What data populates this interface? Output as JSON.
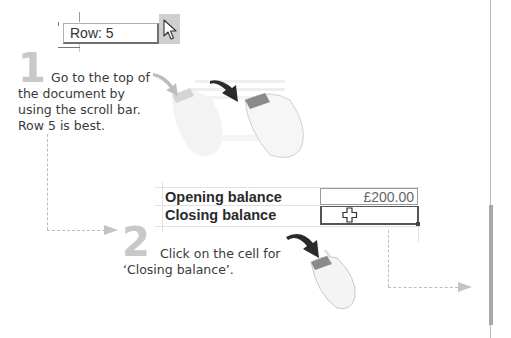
{
  "row_indicator": {
    "label": "Row: 5",
    "cursor_icon": "arrow-pointer-icon"
  },
  "step1": {
    "number": "1",
    "text_line1": "Go to the top of",
    "text_rest": "the document by using the scroll bar. Row 5 is best."
  },
  "step2": {
    "number": "2",
    "text_line1": "Click on the cell for",
    "text_rest": "‘Closing balance’."
  },
  "spreadsheet": {
    "rows": [
      {
        "label": "Opening balance",
        "value": "£200.00"
      },
      {
        "label": "Closing balance",
        "value": ""
      }
    ],
    "cursor_icon": "cell-cross-cursor-icon"
  },
  "illustrations": {
    "mouse1": "mouse-scroll-motion-icon",
    "mouse2": "mouse-click-icon"
  },
  "colors": {
    "step_number": "#c8c8c8",
    "text": "#3a3a3a",
    "mouse_button": "#8a8a8a",
    "arrow": "#2a2a2a",
    "connector": "#bdbdbd"
  }
}
